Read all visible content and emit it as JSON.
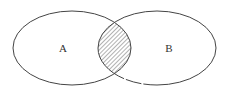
{
  "diagram": {
    "type": "venn",
    "sets": [
      {
        "label": "A",
        "cx": 72,
        "cy": 48,
        "rx": 59,
        "ry": 37
      },
      {
        "label": "B",
        "cx": 157,
        "cy": 48,
        "rx": 59,
        "ry": 37
      }
    ],
    "intersection": {
      "style": "hatched",
      "shaded": true
    },
    "colors": {
      "stroke": "#444444",
      "hatch": "#555555",
      "background": "#ffffff"
    }
  }
}
